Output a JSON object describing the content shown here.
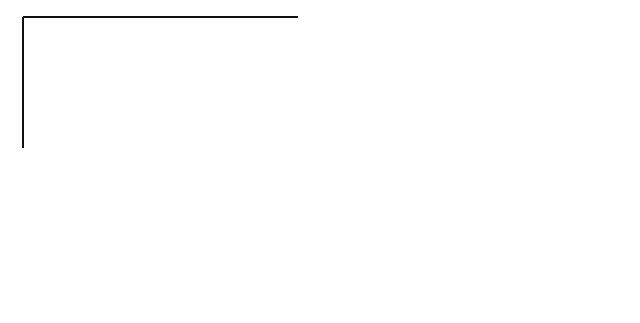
{
  "figure": {
    "panels": [
      {
        "id": "A",
        "caption": "A",
        "labels": {
          "force_large": "F",
          "force_small": "f",
          "radius": "R",
          "offset": "r"
        }
      },
      {
        "id": "B",
        "caption": "B",
        "labels": {
          "force_large": "F",
          "radius": "R",
          "line_left": "c",
          "line_right": "c"
        }
      }
    ],
    "colors": {
      "ink": "#111111",
      "background": "#ffffff"
    }
  }
}
